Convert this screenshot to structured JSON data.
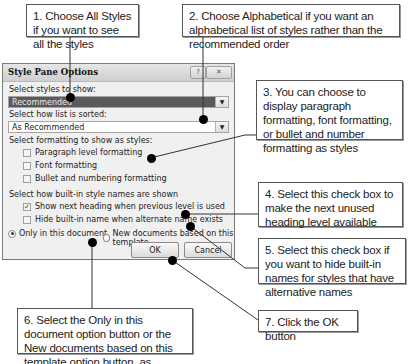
{
  "callouts": [
    {
      "id": 1,
      "text": "1. Choose All Styles if you want to see all the styles"
    },
    {
      "id": 2,
      "text": "2. Choose Alphabetical if you want an alphabetical list of styles rather than the recommended order"
    },
    {
      "id": 3,
      "text": "3. You can choose to display paragraph formatting, font formatting, or bullet and number formatting as styles"
    },
    {
      "id": 4,
      "text": "4. Select this check box to make the next unused heading level available"
    },
    {
      "id": 5,
      "text": "5. Select this check box if you want to hide built-in names for styles that have alternative names"
    },
    {
      "id": 6,
      "text": "6. Select the Only in this document option button or the New documents based on this template option button, as needed"
    },
    {
      "id": 7,
      "text": "7. Click the OK button"
    }
  ],
  "dialog": {
    "title": "Style Pane Options",
    "help_icon": "?",
    "close_icon": "✕",
    "styles_to_show": {
      "label": "Select styles to show:",
      "value": "Recommended"
    },
    "sort": {
      "label": "Select how list is sorted:",
      "value": "As Recommended"
    },
    "formatting": {
      "label": "Select formatting to show as styles:",
      "options": [
        {
          "label": "Paragraph level formatting",
          "checked": false
        },
        {
          "label": "Font formatting",
          "checked": false
        },
        {
          "label": "Bullet and numbering formatting",
          "checked": false
        }
      ]
    },
    "builtin": {
      "label": "Select how built-in style names are shown",
      "options": [
        {
          "label": "Show next heading when previous level is used",
          "checked": true
        },
        {
          "label": "Hide built-in name when alternate name exists",
          "checked": false
        }
      ]
    },
    "scope": {
      "options": [
        {
          "label": "Only in this document",
          "selected": true
        },
        {
          "label": "New documents based on this template",
          "selected": false
        }
      ]
    },
    "ok_label": "OK",
    "cancel_label": "Cancel"
  }
}
